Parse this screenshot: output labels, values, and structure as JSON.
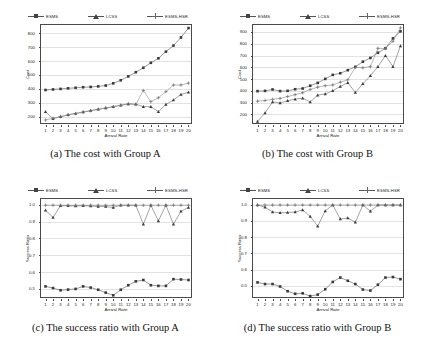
{
  "figure": {
    "legend_entries": [
      {
        "label": "ESMS",
        "marker": "square",
        "color": "#3a3a3a"
      },
      {
        "label": "LCSS",
        "marker": "triangle",
        "color": "#3a3a3a"
      },
      {
        "label": "ESMS-HSR",
        "marker": "plus",
        "color": "#6a6a6a"
      }
    ]
  },
  "chart_data": [
    {
      "id": "a",
      "type": "line",
      "title": "(a) The cost with Group A",
      "xlabel": "Arrival Rate",
      "ylabel": "Cost",
      "x": [
        1,
        2,
        3,
        4,
        5,
        6,
        7,
        8,
        9,
        10,
        11,
        12,
        13,
        14,
        15,
        16,
        17,
        18,
        19,
        20
      ],
      "xticklabels": [
        "1",
        "2",
        "3",
        "4",
        "5",
        "6",
        "7",
        "8",
        "9",
        "10",
        "11",
        "12",
        "13",
        "14",
        "15",
        "16",
        "17",
        "18",
        "19",
        "20"
      ],
      "yticks": [
        200,
        300,
        400,
        500,
        600,
        700,
        800
      ],
      "ylim": [
        140,
        860
      ],
      "xlim": [
        0.4,
        20.6
      ],
      "grid": true,
      "legend_position": "above",
      "series": [
        {
          "name": "ESMS",
          "marker": "square",
          "values": [
            392,
            396,
            400,
            404,
            408,
            412,
            414,
            418,
            424,
            440,
            462,
            490,
            520,
            552,
            588,
            620,
            668,
            712,
            770,
            838
          ]
        },
        {
          "name": "LCSS",
          "marker": "triangle",
          "values": [
            235,
            186,
            200,
            214,
            224,
            234,
            244,
            254,
            262,
            272,
            282,
            292,
            290,
            272,
            272,
            236,
            288,
            320,
            360,
            376
          ]
        },
        {
          "name": "ESMS-HSR",
          "marker": "plus",
          "values": [
            176,
            188,
            200,
            212,
            222,
            232,
            242,
            252,
            262,
            272,
            282,
            292,
            288,
            388,
            308,
            336,
            380,
            428,
            428,
            442
          ]
        }
      ]
    },
    {
      "id": "b",
      "type": "line",
      "title": "(b) The cost with Group B",
      "xlabel": "Arrival Rate",
      "ylabel": "Cost",
      "x": [
        1,
        2,
        3,
        4,
        5,
        6,
        7,
        8,
        9,
        10,
        11,
        12,
        13,
        14,
        15,
        16,
        17,
        18,
        19,
        20
      ],
      "xticklabels": [
        "1",
        "2",
        "3",
        "4",
        "5",
        "6",
        "7",
        "8",
        "9",
        "10",
        "11",
        "12",
        "13",
        "14",
        "15",
        "16",
        "17",
        "18",
        "19",
        "20"
      ],
      "yticks": [
        200,
        300,
        400,
        500,
        600,
        700,
        800,
        900
      ],
      "ylim": [
        110,
        960
      ],
      "xlim": [
        0.4,
        20.6
      ],
      "grid": true,
      "legend_position": "above",
      "series": [
        {
          "name": "ESMS",
          "marker": "square",
          "values": [
            398,
            400,
            412,
            398,
            400,
            414,
            420,
            444,
            468,
            502,
            536,
            550,
            576,
            604,
            648,
            680,
            724,
            762,
            846,
            906
          ]
        },
        {
          "name": "LCSS",
          "marker": "triangle",
          "values": [
            140,
            212,
            306,
            298,
            316,
            330,
            338,
            306,
            364,
            374,
            402,
            438,
            470,
            386,
            460,
            528,
            606,
            700,
            606,
            782
          ]
        },
        {
          "name": "ESMS-HSR",
          "marker": "plus",
          "values": [
            312,
            318,
            328,
            336,
            352,
            368,
            384,
            412,
            432,
            444,
            450,
            474,
            494,
            600,
            596,
            606,
            762,
            760,
            822,
            936
          ]
        }
      ]
    },
    {
      "id": "c",
      "type": "line",
      "title": "(c) The success ratio with Group A",
      "xlabel": "Arrival Rate",
      "ylabel": "Success Ratio",
      "x": [
        1,
        2,
        3,
        4,
        5,
        6,
        7,
        8,
        9,
        10,
        11,
        12,
        13,
        14,
        15,
        16,
        17,
        18,
        19,
        20
      ],
      "xticklabels": [
        "1",
        "2",
        "3",
        "4",
        "5",
        "6",
        "7",
        "8",
        "9",
        "10",
        "11",
        "12",
        "13",
        "14",
        "15",
        "16",
        "17",
        "18",
        "19",
        "20"
      ],
      "yticks": [
        0.5,
        0.6,
        0.7,
        0.8,
        0.9,
        1.0
      ],
      "ylim": [
        0.44,
        1.035
      ],
      "xlim": [
        0.4,
        20.6
      ],
      "grid": true,
      "legend_position": "above",
      "series": [
        {
          "name": "ESMS",
          "marker": "square",
          "values": [
            0.515,
            0.505,
            0.492,
            0.496,
            0.5,
            0.515,
            0.508,
            0.495,
            0.478,
            0.462,
            0.495,
            0.522,
            0.545,
            0.553,
            0.522,
            0.518,
            0.518,
            0.558,
            0.556,
            0.553
          ]
        },
        {
          "name": "LCSS",
          "marker": "triangle",
          "values": [
            0.968,
            0.925,
            0.995,
            0.995,
            0.993,
            0.995,
            0.993,
            0.99,
            0.99,
            0.985,
            0.998,
            0.998,
            0.998,
            0.885,
            0.998,
            0.905,
            0.998,
            0.885,
            0.962,
            0.985
          ]
        },
        {
          "name": "ESMS-HSR",
          "marker": "plus",
          "values": [
            0.998,
            0.998,
            0.998,
            0.998,
            0.998,
            0.998,
            0.998,
            0.998,
            0.998,
            0.998,
            0.998,
            0.998,
            0.998,
            0.998,
            0.998,
            0.998,
            0.998,
            0.998,
            0.998,
            0.998
          ]
        }
      ]
    },
    {
      "id": "d",
      "type": "line",
      "title": "(d) The success ratio with Group B",
      "xlabel": "Arrival Rate",
      "ylabel": "Success Ratio",
      "x": [
        1,
        2,
        3,
        4,
        5,
        6,
        7,
        8,
        9,
        10,
        11,
        12,
        13,
        14,
        15,
        16,
        17,
        18,
        19,
        20
      ],
      "xticklabels": [
        "1",
        "2",
        "3",
        "4",
        "5",
        "6",
        "7",
        "8",
        "9",
        "10",
        "11",
        "12",
        "13",
        "14",
        "15",
        "16",
        "17",
        "18",
        "19",
        "20"
      ],
      "yticks": [
        0.5,
        0.6,
        0.7,
        0.8,
        0.9,
        1.0
      ],
      "ylim": [
        0.42,
        1.035
      ],
      "xlim": [
        0.4,
        20.6
      ],
      "grid": true,
      "legend_position": "above",
      "series": [
        {
          "name": "ESMS",
          "marker": "square",
          "values": [
            0.522,
            0.512,
            0.512,
            0.497,
            0.468,
            0.452,
            0.455,
            0.438,
            0.447,
            0.48,
            0.525,
            0.552,
            0.532,
            0.512,
            0.478,
            0.472,
            0.508,
            0.552,
            0.555,
            0.542
          ]
        },
        {
          "name": "LCSS",
          "marker": "triangle",
          "values": [
            0.998,
            0.985,
            0.955,
            0.95,
            0.952,
            0.955,
            0.968,
            0.928,
            0.868,
            0.962,
            0.998,
            0.912,
            0.918,
            0.892,
            0.998,
            0.96,
            0.998,
            0.998,
            0.998,
            0.998
          ]
        },
        {
          "name": "ESMS-HSR",
          "marker": "plus",
          "values": [
            0.998,
            0.998,
            0.998,
            0.998,
            0.998,
            0.998,
            0.998,
            0.998,
            0.998,
            0.998,
            0.998,
            0.998,
            0.998,
            0.998,
            0.998,
            0.998,
            0.998,
            0.998,
            0.998,
            0.998
          ]
        }
      ]
    }
  ]
}
